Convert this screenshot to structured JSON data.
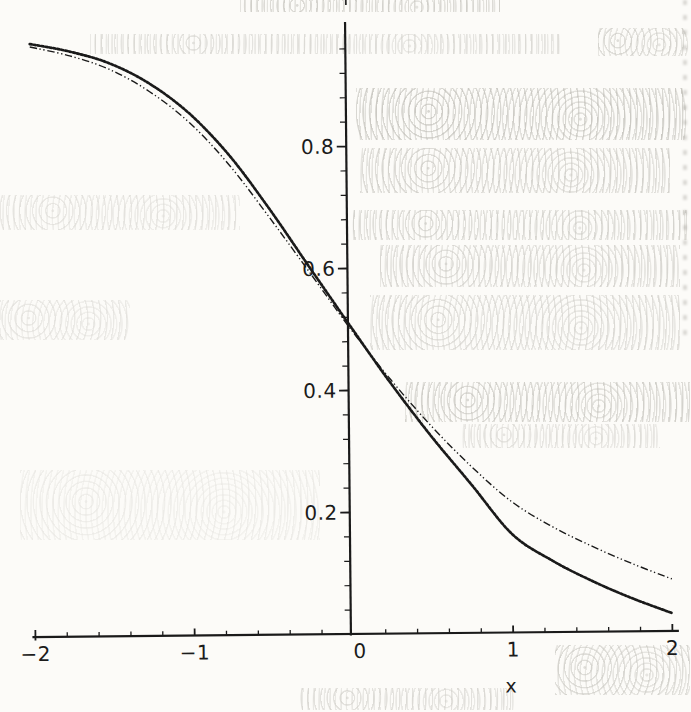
{
  "colors": {
    "ink": "#1a1a1a",
    "paper": "#fcfbf8",
    "bleedthrough": "#7a776c"
  },
  "chart_data": {
    "type": "line",
    "title": "",
    "xlabel": "x",
    "ylabel": "",
    "xlim": [
      -2,
      2
    ],
    "ylim": [
      0,
      1
    ],
    "grid": false,
    "legend": "none",
    "x_major_ticks": [
      -2,
      -1,
      0,
      1,
      2
    ],
    "x_tick_labels": [
      "−2",
      "−1",
      "0",
      "1",
      "2"
    ],
    "x_minor_step": 0.2,
    "y_major_ticks": [
      0.2,
      0.4,
      0.6,
      0.8
    ],
    "y_tick_labels": [
      "0.2",
      "0.4",
      "0.6",
      "0.8"
    ],
    "y_minor_step": 0.04,
    "x": [
      -2,
      -1.75,
      -1.5,
      -1.25,
      -1,
      -0.75,
      -0.5,
      -0.25,
      0,
      0.25,
      0.5,
      0.75,
      1,
      1.25,
      1.5,
      1.75,
      2
    ],
    "series": [
      {
        "name": "dense-dotted thick curve (normal-ogive-like)",
        "style": "dotted-thick",
        "values": [
          0.973,
          0.96,
          0.94,
          0.906,
          0.856,
          0.786,
          0.697,
          0.6,
          0.504,
          0.41,
          0.323,
          0.243,
          0.162,
          0.118,
          0.084,
          0.055,
          0.03
        ]
      },
      {
        "name": "dash-dot thin curve (heavier right tail)",
        "style": "dash-dot-thin",
        "values": [
          0.968,
          0.953,
          0.93,
          0.893,
          0.841,
          0.77,
          0.683,
          0.592,
          0.5,
          0.416,
          0.34,
          0.273,
          0.215,
          0.174,
          0.141,
          0.112,
          0.086
        ]
      }
    ]
  }
}
